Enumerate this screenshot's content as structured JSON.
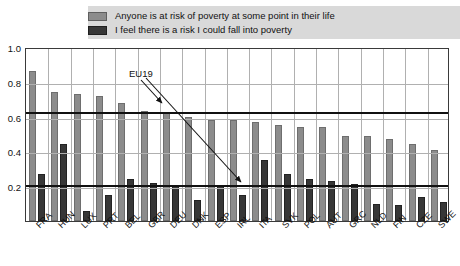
{
  "legend": {
    "items": [
      {
        "label": "Anyone is at risk of poverty at some point in their life",
        "swatch": "light-gray",
        "color": "#8c8c8c"
      },
      {
        "label": "I feel there is a risk I could fall into poverty",
        "swatch": "dark-gray",
        "color": "#373737"
      }
    ]
  },
  "annotation": {
    "label": "EU19",
    "description": "Arrows point to the EU19 average reference lines"
  },
  "axis": {
    "y_ticks": [
      "1.0",
      "0.8",
      "0.6",
      "0.4",
      "0.2"
    ],
    "y_tick_values": [
      1.0,
      0.8,
      0.6,
      0.4,
      0.2
    ]
  },
  "chart_data": {
    "type": "bar",
    "title": "",
    "subtitle": "",
    "xlabel": "",
    "ylabel": "",
    "ylim": [
      0,
      1.0
    ],
    "grid": true,
    "legend_position": "top",
    "categories": [
      "FRA",
      "HUN",
      "LUX",
      "PRT",
      "BEL",
      "GBR",
      "DEU",
      "DNK",
      "ESP",
      "IRL",
      "ITA",
      "SVK",
      "POL",
      "AUT",
      "GRC",
      "NLD",
      "FIN",
      "CZE",
      "SWE"
    ],
    "series": [
      {
        "name": "Anyone is at risk of poverty at some point in their life",
        "color": "#8c8c8c",
        "values": [
          0.86,
          0.74,
          0.73,
          0.72,
          0.68,
          0.63,
          0.62,
          0.6,
          0.58,
          0.58,
          0.57,
          0.55,
          0.54,
          0.54,
          0.49,
          0.49,
          0.47,
          0.44,
          0.41
        ]
      },
      {
        "name": "I feel there is a risk I could fall into poverty",
        "color": "#373737",
        "values": [
          0.27,
          0.44,
          0.06,
          0.15,
          0.24,
          0.22,
          0.2,
          0.12,
          0.2,
          0.15,
          0.35,
          0.27,
          0.24,
          0.23,
          0.21,
          0.1,
          0.09,
          0.14,
          0.11
        ]
      }
    ],
    "reference_lines": [
      {
        "name": "EU19",
        "value": 0.63,
        "series": "Anyone is at risk of poverty at some point in their life"
      },
      {
        "name": "EU19",
        "value": 0.21,
        "series": "I feel there is a risk I could fall into poverty"
      }
    ]
  }
}
